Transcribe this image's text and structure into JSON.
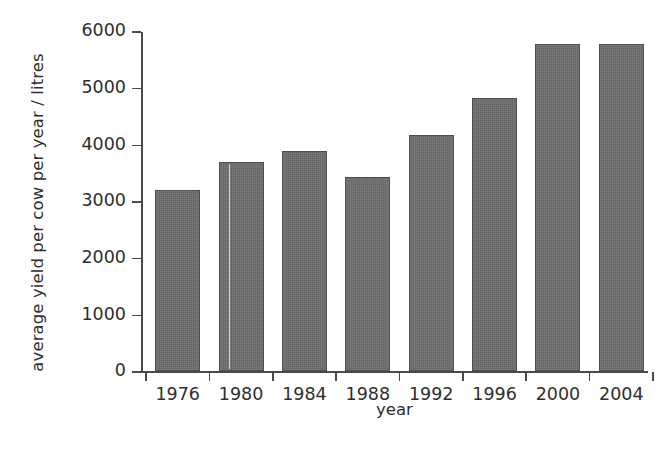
{
  "chart_data": {
    "type": "bar",
    "title": "",
    "subtitle": "",
    "xlabel": "year",
    "ylabel": "average yield per cow per year / litres",
    "categories": [
      "1976",
      "1980",
      "1984",
      "1988",
      "1992",
      "1996",
      "2000",
      "2004"
    ],
    "values": [
      3200,
      3680,
      3880,
      3420,
      4160,
      4820,
      5770,
      5770
    ],
    "ylim": [
      0,
      6000
    ],
    "ytick_labels": [
      "0",
      "1000",
      "2000",
      "3000",
      "4000",
      "5000",
      "6000"
    ],
    "ytick_values": [
      0,
      1000,
      2000,
      3000,
      4000,
      5000,
      6000
    ],
    "grid": false,
    "legend": null,
    "bar_color": "#6d6d6d",
    "axis_color": "#4a4a4a",
    "background_color": "#ffffff"
  }
}
